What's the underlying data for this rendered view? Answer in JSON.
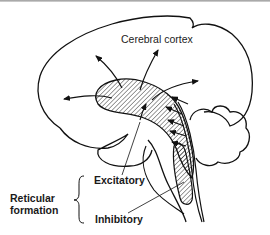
{
  "diagram": {
    "labels": {
      "cerebral_cortex": "Cerebral cortex",
      "excitatory": "Excitatory",
      "inhibitory": "Inhibitory",
      "reticular_line1": "Reticular",
      "reticular_line2": "formation"
    },
    "colors": {
      "stroke": "#111111",
      "background": "#ffffff",
      "label": "#1a1a1a"
    },
    "structures": [
      "cerebrum",
      "cerebellum",
      "brainstem",
      "thalamic projection area (hatched)",
      "reticular inhibitory area (hatched)"
    ],
    "arrows": {
      "outward_projections": 5,
      "ascending_inputs": 4
    }
  }
}
